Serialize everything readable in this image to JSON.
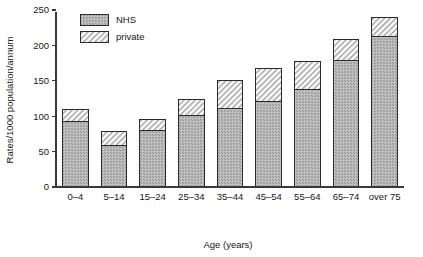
{
  "chart_data": {
    "type": "bar",
    "stacked": true,
    "title": "",
    "subtitle": "",
    "xlabel": "Age (years)",
    "ylabel": "Rates/1000 population/annum",
    "categories": [
      "0–4",
      "5–14",
      "15–24",
      "25–34",
      "35–44",
      "45–54",
      "55–64",
      "65–74",
      "over 75"
    ],
    "series": [
      {
        "name": "NHS",
        "pattern": "stipple-checker",
        "color": "#9b9b9b",
        "values": [
          93,
          59,
          80,
          101,
          111,
          121,
          138,
          179,
          212
        ]
      },
      {
        "name": "private",
        "pattern": "diagonal-hatch",
        "color": "#d8d8d8",
        "values": [
          16,
          19,
          16,
          23,
          40,
          47,
          39,
          30,
          27
        ]
      }
    ],
    "totals": [
      109,
      78,
      96,
      124,
      151,
      168,
      177,
      209,
      239
    ],
    "ylim": [
      0,
      250
    ],
    "yticks": [
      0,
      50,
      100,
      150,
      200,
      250
    ],
    "ytick_labels": [
      "0",
      "50",
      "100",
      "150",
      "200",
      "250"
    ],
    "grid": false,
    "legend_position": "top-left-inside",
    "axis_color": "#3a3a3a"
  },
  "legend": {
    "entries": [
      {
        "label": "NHS"
      },
      {
        "label": "private"
      }
    ]
  }
}
